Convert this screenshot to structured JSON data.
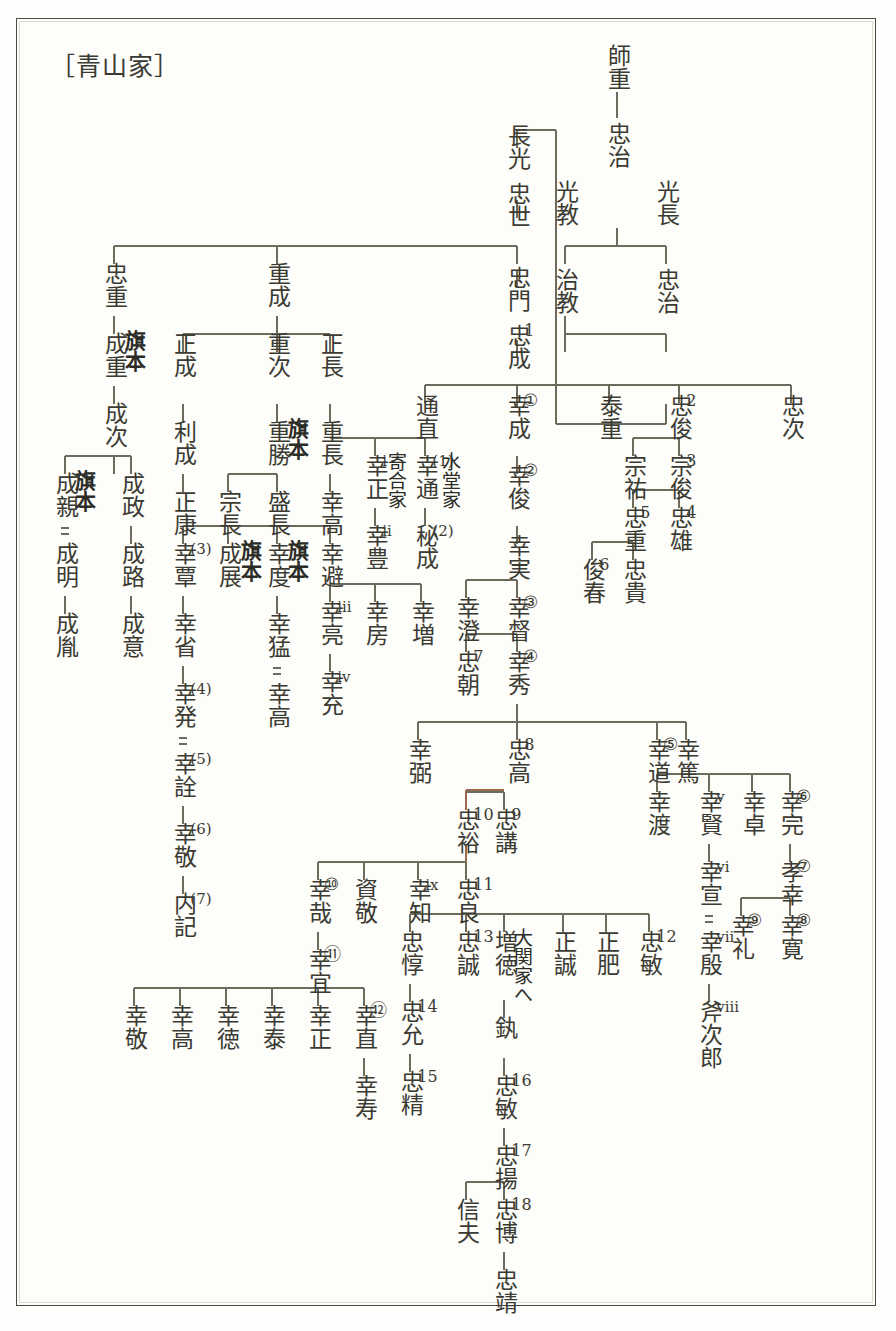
{
  "document": {
    "title": "［青山家］",
    "kind": "genealogy-chart",
    "family": "青山家",
    "line_color": "#6b6b5e",
    "accent_line_color": "#9a6a4e",
    "text_color": "#3b3b33",
    "background": "#fdfdfa",
    "border_color": "#4b4b42"
  },
  "legend": {
    "double_line_meaning": "＝（養子）",
    "circled_numbers_meaning": "青山幸成系代数",
    "plain_numbers_meaning": "青山忠成系代数"
  },
  "annotations": [
    {
      "id": "a-hatamoto-1",
      "text": "旗本",
      "bold": true
    },
    {
      "id": "a-hatamoto-2",
      "text": "旗本",
      "bold": true
    },
    {
      "id": "a-hatamoto-3",
      "text": "旗本",
      "bold": true
    },
    {
      "id": "a-hatamoto-4",
      "text": "旗本",
      "bold": true
    },
    {
      "id": "a-hatamoto-5",
      "text": "旗本",
      "bold": true
    },
    {
      "id": "a-yoriai",
      "text": "寄合家",
      "bold": false
    },
    {
      "id": "a-suido",
      "text": "水堂家",
      "bold": false
    },
    {
      "id": "a-ozeki",
      "text": "大関家へ",
      "bold": false
    }
  ],
  "nodes": [
    {
      "id": "n-morosige",
      "name": "師重",
      "idx": ""
    },
    {
      "id": "n-tadaharu",
      "name": "忠治",
      "idx": ""
    },
    {
      "id": "n-mitsunori",
      "name": "光教",
      "idx": ""
    },
    {
      "id": "n-mitsunaga",
      "name": "光長",
      "idx": ""
    },
    {
      "id": "n-harunori",
      "name": "治教",
      "idx": ""
    },
    {
      "id": "n-tadaharu2",
      "name": "忠治",
      "idx": ""
    },
    {
      "id": "n-nagamitsu",
      "name": "長光",
      "idx": ""
    },
    {
      "id": "n-tadayo",
      "name": "忠世",
      "idx": ""
    },
    {
      "id": "n-tadakado",
      "name": "忠門",
      "idx": ""
    },
    {
      "id": "n-tadanari",
      "name": "忠成",
      "idx": "1"
    },
    {
      "id": "n-tadashige",
      "name": "忠重",
      "idx": ""
    },
    {
      "id": "n-narishige",
      "name": "成重",
      "idx": ""
    },
    {
      "id": "n-naritsugu",
      "name": "成次",
      "idx": ""
    },
    {
      "id": "n-narichika",
      "name": "成親",
      "idx": ""
    },
    {
      "id": "n-narimasa",
      "name": "成政",
      "idx": ""
    },
    {
      "id": "n-nariakira",
      "name": "成明",
      "idx": ""
    },
    {
      "id": "n-narimichi",
      "name": "成路",
      "idx": ""
    },
    {
      "id": "n-narikazu",
      "name": "成胤",
      "idx": ""
    },
    {
      "id": "n-narioki",
      "name": "成意",
      "idx": ""
    },
    {
      "id": "n-shigenari",
      "name": "重成",
      "idx": ""
    },
    {
      "id": "n-masanari",
      "name": "正成",
      "idx": ""
    },
    {
      "id": "n-shigetsugu",
      "name": "重次",
      "idx": ""
    },
    {
      "id": "n-masanaga",
      "name": "正長",
      "idx": ""
    },
    {
      "id": "n-toshinari",
      "name": "利成",
      "idx": ""
    },
    {
      "id": "n-shigekatsu",
      "name": "重勝",
      "idx": ""
    },
    {
      "id": "n-shigenaga",
      "name": "重長",
      "idx": ""
    },
    {
      "id": "n-masayasu",
      "name": "正康",
      "idx": ""
    },
    {
      "id": "n-munenaga",
      "name": "宗長",
      "idx": ""
    },
    {
      "id": "n-morinaga",
      "name": "盛長",
      "idx": ""
    },
    {
      "id": "n-yukitaka",
      "name": "幸高",
      "idx": ""
    },
    {
      "id": "n-yukitan",
      "name": "幸覃",
      "idx": "(3)"
    },
    {
      "id": "n-naritsura",
      "name": "成展",
      "idx": ""
    },
    {
      "id": "n-yukinori",
      "name": "幸度",
      "idx": ""
    },
    {
      "id": "n-yukisake",
      "name": "幸避",
      "idx": ""
    },
    {
      "id": "n-yukisei",
      "name": "幸省",
      "idx": ""
    },
    {
      "id": "n-yukitake",
      "name": "幸猛",
      "idx": ""
    },
    {
      "id": "n-yukiaki",
      "name": "幸亮",
      "idx": "iii"
    },
    {
      "id": "n-yukifusa",
      "name": "幸房",
      "idx": ""
    },
    {
      "id": "n-yukimasu",
      "name": "幸増",
      "idx": ""
    },
    {
      "id": "n-yukihatsu",
      "name": "幸発",
      "idx": "(4)"
    },
    {
      "id": "n-yukitaka2",
      "name": "幸高",
      "idx": ""
    },
    {
      "id": "n-yukimitsu",
      "name": "幸充",
      "idx": "iv"
    },
    {
      "id": "n-yukiaki2",
      "name": "幸詮",
      "idx": "(5)"
    },
    {
      "id": "n-yukitaka3",
      "name": "幸敬",
      "idx": "(6)"
    },
    {
      "id": "n-naiki",
      "name": "内記",
      "idx": "(7)"
    },
    {
      "id": "n-michinao",
      "name": "通直",
      "idx": ""
    },
    {
      "id": "n-yukimasa-i",
      "name": "幸正",
      "idx": "i"
    },
    {
      "id": "n-yukimichi",
      "name": "幸通",
      "idx": "(1)"
    },
    {
      "id": "n-yukitoyo",
      "name": "幸豊",
      "idx": "ii"
    },
    {
      "id": "n-hidenari",
      "name": "秘成",
      "idx": "(2)"
    },
    {
      "id": "n-yukinari",
      "name": "幸成",
      "idx": "①"
    },
    {
      "id": "n-yukitoshi",
      "name": "幸俊",
      "idx": "②"
    },
    {
      "id": "n-yukizane",
      "name": "幸実",
      "idx": ""
    },
    {
      "id": "n-yukizumi",
      "name": "幸澄",
      "idx": ""
    },
    {
      "id": "n-yukitada",
      "name": "幸督",
      "idx": "③"
    },
    {
      "id": "n-tadatomo",
      "name": "忠朝",
      "idx": "7"
    },
    {
      "id": "n-yukihide",
      "name": "幸秀",
      "idx": "④"
    },
    {
      "id": "n-yasushige",
      "name": "泰重",
      "idx": ""
    },
    {
      "id": "n-tadatoshi",
      "name": "忠俊",
      "idx": "2"
    },
    {
      "id": "n-tadatsugu",
      "name": "忠次",
      "idx": ""
    },
    {
      "id": "n-munesuke",
      "name": "宗祐",
      "idx": ""
    },
    {
      "id": "n-munetoshi",
      "name": "宗俊",
      "idx": "3"
    },
    {
      "id": "n-tadashige5",
      "name": "忠重",
      "idx": "5"
    },
    {
      "id": "n-tadao",
      "name": "忠雄",
      "idx": "4"
    },
    {
      "id": "n-toshiharu",
      "name": "俊春",
      "idx": "6"
    },
    {
      "id": "n-tadataka-k",
      "name": "忠貴",
      "idx": ""
    },
    {
      "id": "n-yukisuke",
      "name": "幸弼",
      "idx": ""
    },
    {
      "id": "n-tadataka8",
      "name": "忠高",
      "idx": "8"
    },
    {
      "id": "n-yukimichi5",
      "name": "幸道",
      "idx": "⑤"
    },
    {
      "id": "n-yukiatsu",
      "name": "幸篤",
      "idx": ""
    },
    {
      "id": "n-tadahiro10",
      "name": "忠裕",
      "idx": "10"
    },
    {
      "id": "n-tadatsugu9",
      "name": "忠講",
      "idx": "9"
    },
    {
      "id": "n-yukiwatari",
      "name": "幸渡",
      "idx": ""
    },
    {
      "id": "n-yukikata-v",
      "name": "幸賢",
      "idx": "v"
    },
    {
      "id": "n-yukitaku",
      "name": "幸卓",
      "idx": ""
    },
    {
      "id": "n-yukisada6",
      "name": "幸完",
      "idx": "⑥"
    },
    {
      "id": "n-yukiya10",
      "name": "幸哉",
      "idx": "⑩"
    },
    {
      "id": "n-sukeyoshi",
      "name": "資敬",
      "idx": ""
    },
    {
      "id": "n-yukitomo-ix",
      "name": "幸知",
      "idx": "ix"
    },
    {
      "id": "n-tadayoshi11",
      "name": "忠良",
      "idx": "11"
    },
    {
      "id": "n-yukinobu-vi",
      "name": "幸宣",
      "idx": "vi"
    },
    {
      "id": "n-takayuki7",
      "name": "孝幸",
      "idx": "⑦"
    },
    {
      "id": "n-yukiyoshi11",
      "name": "幸宜",
      "idx": "⑪"
    },
    {
      "id": "n-tadaatsu",
      "name": "忠惇",
      "idx": ""
    },
    {
      "id": "n-tadamasa13",
      "name": "忠誠",
      "idx": "13"
    },
    {
      "id": "n-masunori",
      "name": "増徳",
      "idx": ""
    },
    {
      "id": "n-masashige",
      "name": "正誠",
      "idx": ""
    },
    {
      "id": "n-masahiro",
      "name": "正肥",
      "idx": ""
    },
    {
      "id": "n-tadatoshi12",
      "name": "忠敏",
      "idx": "12"
    },
    {
      "id": "n-yukiyoshi-vii",
      "name": "幸殷",
      "idx": "vii"
    },
    {
      "id": "n-yukirei9",
      "name": "幸礼",
      "idx": "⑨"
    },
    {
      "id": "n-yukihiro8",
      "name": "幸寛",
      "idx": "⑧"
    },
    {
      "id": "n-yukitaka-b1",
      "name": "幸敬",
      "idx": ""
    },
    {
      "id": "n-yukitaka-b2",
      "name": "幸高",
      "idx": ""
    },
    {
      "id": "n-yukinori-b3",
      "name": "幸徳",
      "idx": ""
    },
    {
      "id": "n-yukiyasu-b4",
      "name": "幸泰",
      "idx": ""
    },
    {
      "id": "n-yukimasa-b5",
      "name": "幸正",
      "idx": ""
    },
    {
      "id": "n-yukinao12",
      "name": "幸直",
      "idx": "⑫"
    },
    {
      "id": "n-tadamitsu14",
      "name": "忠允",
      "idx": "14"
    },
    {
      "id": "n-suki",
      "name": "釻",
      "idx": ""
    },
    {
      "id": "n-onojiro-viii",
      "name": "斧次郎",
      "idx": "viii"
    },
    {
      "id": "n-yukitoshi-b",
      "name": "幸寿",
      "idx": ""
    },
    {
      "id": "n-tadakiyo15",
      "name": "忠精",
      "idx": "15"
    },
    {
      "id": "n-tadatoshi16",
      "name": "忠敏",
      "idx": "16"
    },
    {
      "id": "n-tadaakira17",
      "name": "忠揚",
      "idx": "17"
    },
    {
      "id": "n-nobuo",
      "name": "信夫",
      "idx": ""
    },
    {
      "id": "n-tadahiro18",
      "name": "忠博",
      "idx": "18"
    },
    {
      "id": "n-tadayasu",
      "name": "忠靖",
      "idx": ""
    }
  ]
}
